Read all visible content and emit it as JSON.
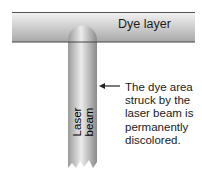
{
  "diagram": {
    "layer": {
      "label": "Dye layer",
      "color_top": "#f2f2f2",
      "color_bottom": "#a6a6a6"
    },
    "beam": {
      "label": "Laser beam",
      "color_light": "#e8e8e8",
      "color_dark": "#8e8e8e"
    },
    "callout": {
      "lines": [
        "The dye area",
        "struck by the",
        "laser beam is",
        "permanently",
        "discolored."
      ]
    },
    "arrow": {
      "direction": "left"
    }
  }
}
